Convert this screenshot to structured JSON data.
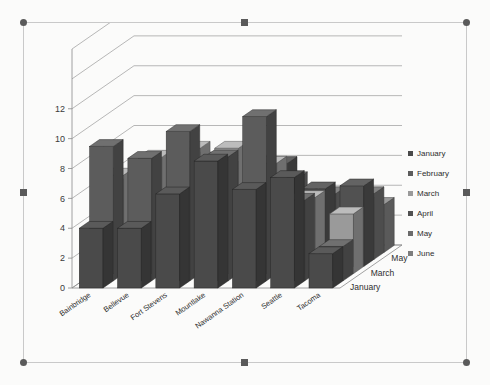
{
  "selection": {
    "state": "selected",
    "handle_count": 8,
    "handles": [
      "top-left",
      "top-center",
      "top-right",
      "middle-left",
      "middle-right",
      "bottom-left",
      "bottom-center",
      "bottom-right"
    ]
  },
  "legend": {
    "position": "right",
    "entries": [
      {
        "label": "January",
        "color": "#4a4a4a"
      },
      {
        "label": "February",
        "color": "#5c5c5c"
      },
      {
        "label": "March",
        "color": "#9a9a9a"
      },
      {
        "label": "April",
        "color": "#515151"
      },
      {
        "label": "May",
        "color": "#6b6b6b"
      },
      {
        "label": "June",
        "color": "#7d7d7d"
      }
    ]
  },
  "chart_data": {
    "type": "bar",
    "subtype": "3d-clustered-column",
    "title": "",
    "subtitle": "",
    "xlabel": "",
    "ylabel": "",
    "zlabel": "",
    "grid": true,
    "ylim": [
      0,
      16
    ],
    "yticks": [
      0,
      2,
      4,
      6,
      8,
      10,
      12
    ],
    "ytick_labels": [
      "0",
      "2",
      "4",
      "6",
      "8",
      "10",
      "12"
    ],
    "categories": [
      "Bainbridge",
      "Bellevue",
      "Fort Stevens",
      "Mountlake",
      "Nawanna Station",
      "Seattle",
      "Tacoma"
    ],
    "depth_axis_labels": [
      "January",
      "March",
      "May"
    ],
    "series": [
      {
        "name": "January",
        "color": "#4a4a4a",
        "values": [
          4,
          4,
          6.3,
          8.5,
          6.6,
          7.4,
          2.3
        ]
      },
      {
        "name": "February",
        "color": "#5c5c5c",
        "values": [
          9,
          8.2,
          10,
          8.3,
          11,
          5.4,
          2.3
        ]
      },
      {
        "name": "March",
        "color": "#9a9a9a",
        "values": [
          6.6,
          7.8,
          8.4,
          8.4,
          7.4,
          5.1,
          4
        ]
      },
      {
        "name": "April",
        "color": "#515151",
        "values": [
          5.4,
          6.2,
          7.2,
          6.6,
          6.9,
          5.2,
          5.4
        ]
      },
      {
        "name": "May",
        "color": "#6b6b6b",
        "values": [
          4.4,
          5.3,
          5.6,
          5.4,
          5.4,
          4.4,
          4.4
        ]
      },
      {
        "name": "June",
        "color": "#7d7d7d",
        "values": [
          3.6,
          3.9,
          4.2,
          4.1,
          3.9,
          3.4,
          3.2
        ]
      }
    ]
  }
}
